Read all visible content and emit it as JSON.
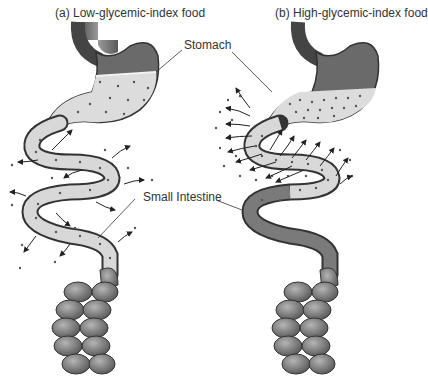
{
  "panels": [
    {
      "id": "a",
      "title": "(a) Low-glycemic-index food",
      "description": "Stomach retains food; slow, gradual absorption along the whole small intestine"
    },
    {
      "id": "b",
      "title": "(b) High-glycemic-index food",
      "description": "Stomach empties quickly; rapid absorption in upper small intestine"
    }
  ],
  "labels": {
    "stomach": "Stomach",
    "small_intestine": "Small Intestine"
  },
  "colors": {
    "organ_dark": "#555555",
    "organ_mid": "#8a8a8a",
    "content_fill": "#dcdcdc",
    "dots": "#555555",
    "arrows": "#222222",
    "text": "#333333"
  }
}
